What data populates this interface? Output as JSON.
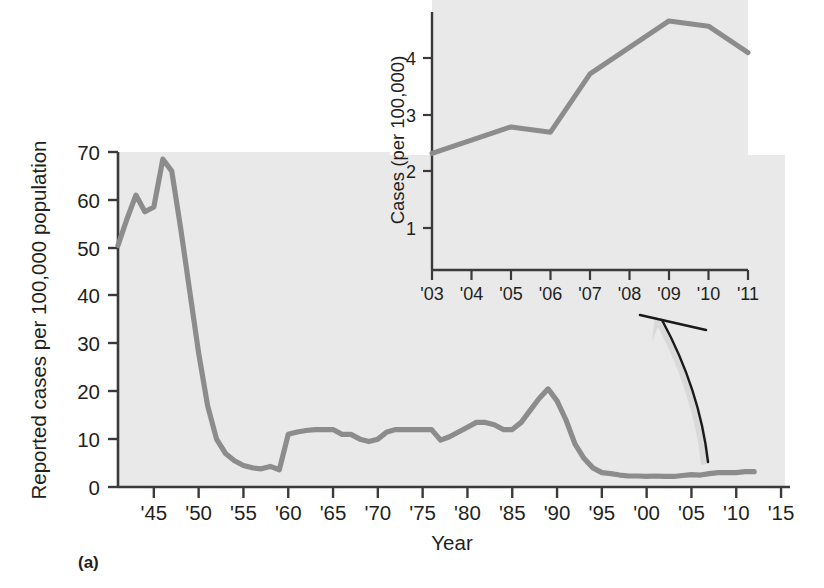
{
  "figure": {
    "caption": "(a)",
    "panel_background": "#e9e9e9",
    "line_color": "#8c8c8c",
    "axis_color": "#3a3a3a",
    "text_color": "#231f20"
  },
  "chart_data": [
    {
      "id": "main",
      "type": "line",
      "title": "",
      "xlabel": "Year",
      "ylabel": "Reported cases per 100,000 population",
      "xlim": [
        1941,
        2016
      ],
      "ylim": [
        0,
        70
      ],
      "grid": false,
      "legend": null,
      "xticks": [
        1945,
        1950,
        1955,
        1960,
        1965,
        1970,
        1975,
        1980,
        1985,
        1990,
        1995,
        2000,
        2005,
        2010,
        2015
      ],
      "xticklabels": [
        "'45",
        "'50",
        "'55",
        "'60",
        "'65",
        "'70",
        "'75",
        "'80",
        "'85",
        "'90",
        "'95",
        "'00",
        "'05",
        "'10",
        "'15"
      ],
      "yticks": [
        0,
        10,
        20,
        30,
        40,
        50,
        60,
        70
      ],
      "yticklabels": [
        "0",
        "10",
        "20",
        "30",
        "40",
        "50",
        "60",
        "70"
      ],
      "x": [
        1941,
        1942,
        1943,
        1944,
        1945,
        1946,
        1947,
        1948,
        1949,
        1950,
        1951,
        1952,
        1953,
        1954,
        1955,
        1956,
        1957,
        1958,
        1959,
        1960,
        1961,
        1962,
        1963,
        1964,
        1965,
        1966,
        1967,
        1968,
        1969,
        1970,
        1971,
        1972,
        1973,
        1974,
        1975,
        1976,
        1977,
        1978,
        1979,
        1980,
        1981,
        1982,
        1983,
        1984,
        1985,
        1986,
        1987,
        1988,
        1989,
        1990,
        1991,
        1992,
        1993,
        1994,
        1995,
        1996,
        1997,
        1998,
        1999,
        2000,
        2001,
        2002,
        2003,
        2004,
        2005,
        2006,
        2007,
        2008,
        2009,
        2010,
        2011,
        2012
      ],
      "values": [
        50.5,
        56.0,
        61.0,
        57.5,
        58.5,
        68.5,
        66.0,
        54.0,
        41.0,
        28.0,
        17.0,
        10.0,
        7.0,
        5.5,
        4.5,
        4.0,
        3.8,
        4.3,
        3.6,
        11.0,
        11.5,
        11.8,
        12.0,
        12.0,
        12.0,
        11.0,
        11.0,
        10.0,
        9.5,
        10.0,
        11.5,
        12.0,
        12.0,
        12.0,
        12.0,
        12.0,
        9.8,
        10.5,
        11.5,
        12.5,
        13.5,
        13.5,
        13.0,
        12.0,
        12.0,
        13.5,
        16.0,
        18.5,
        20.5,
        18.0,
        14.0,
        9.0,
        6.0,
        4.0,
        3.0,
        2.8,
        2.5,
        2.3,
        2.3,
        2.2,
        2.3,
        2.2,
        2.2,
        2.4,
        2.6,
        2.5,
        2.8,
        3.0,
        3.0,
        3.0,
        3.2,
        3.2
      ]
    },
    {
      "id": "inset",
      "type": "line",
      "title": "",
      "xlabel": "",
      "ylabel": "Cases (per 100,000)",
      "xlim": [
        2003,
        2011
      ],
      "ylim": [
        0,
        5
      ],
      "grid": false,
      "legend": null,
      "xticks": [
        2003,
        2004,
        2005,
        2006,
        2007,
        2008,
        2009,
        2010,
        2011
      ],
      "xticklabels": [
        "'03",
        "'04",
        "'05",
        "'06",
        "'07",
        "'08",
        "'09",
        "'10",
        "'11"
      ],
      "yticks": [
        1,
        2,
        3,
        4
      ],
      "yticklabels": [
        "1",
        "2",
        "3",
        "4"
      ],
      "x": [
        2003,
        2004,
        2005,
        2006,
        2007,
        2008,
        2009,
        2010,
        2011
      ],
      "values": [
        2.2,
        2.45,
        2.7,
        2.6,
        3.7,
        4.2,
        4.7,
        4.6,
        4.1
      ]
    }
  ],
  "annotations": {
    "callout_arrow": "curved-arrow-from-main-line-to-inset"
  }
}
